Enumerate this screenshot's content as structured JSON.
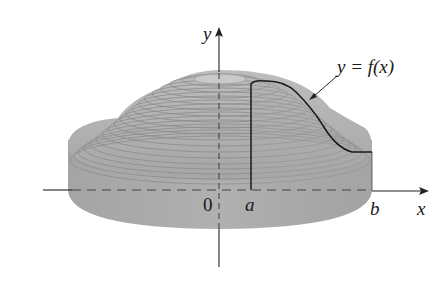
{
  "figure": {
    "labels": {
      "y_axis": "y",
      "x_axis": "x",
      "origin": "0",
      "a": "a",
      "b": "b",
      "curve": "y = f(x)"
    },
    "colors": {
      "background": "#ffffff",
      "solid_fill": "#a9a9a9",
      "solid_top": "#b3b3b3",
      "ring_lines": "#8a8a8a",
      "axis": "#222222",
      "curve": "#1a1a1a"
    }
  }
}
